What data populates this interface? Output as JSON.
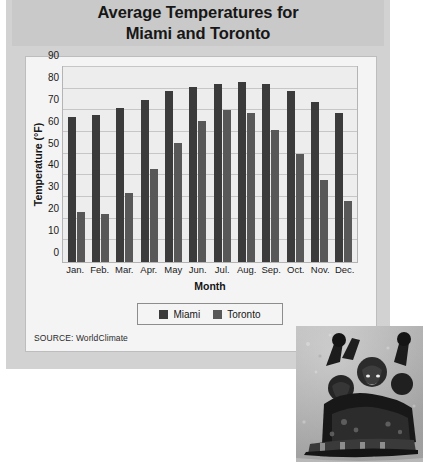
{
  "title": "Average Temperatures for\nMiami and Toronto",
  "source_note": "SOURCE: WorldClimate",
  "photo": {
    "caption": "children sledding in snow"
  },
  "colors": {
    "miami": "#3b3b3b",
    "toronto": "#585858",
    "panel": "#d2d2d2",
    "title_band": "#c9c9c9",
    "card": "#f4f4f4",
    "plot_area": "#ededed",
    "gridline": "#c6c6c6"
  },
  "chart_data": {
    "type": "bar",
    "title": "Average Temperatures for Miami and Toronto",
    "xlabel": "Month",
    "ylabel": "Temperature (°F)",
    "ylim": [
      0,
      90
    ],
    "yticks": [
      0,
      10,
      20,
      30,
      40,
      50,
      60,
      70,
      80,
      90
    ],
    "grid": true,
    "legend_position": "bottom",
    "categories": [
      "Jan.",
      "Feb.",
      "Mar.",
      "Apr.",
      "May",
      "Jun.",
      "Jul.",
      "Aug.",
      "Sep.",
      "Oct.",
      "Nov.",
      "Dec."
    ],
    "series": [
      {
        "name": "Miami",
        "color": "#3b3b3b",
        "values": [
          67,
          68,
          71,
          75,
          79,
          81,
          82,
          83,
          82,
          79,
          74,
          69
        ]
      },
      {
        "name": "Toronto",
        "color": "#585858",
        "values": [
          23,
          22,
          32,
          43,
          55,
          65,
          70,
          69,
          61,
          50,
          38,
          28
        ]
      }
    ]
  }
}
